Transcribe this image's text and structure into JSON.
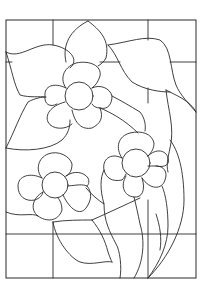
{
  "image": {
    "subject": "stained glass flower pattern",
    "style": "black line art on white",
    "colors": {
      "background": "#ffffff",
      "line": "#2a2a2a"
    },
    "elements": {
      "flowers": 3,
      "leaves": 6,
      "stems": 3
    }
  }
}
